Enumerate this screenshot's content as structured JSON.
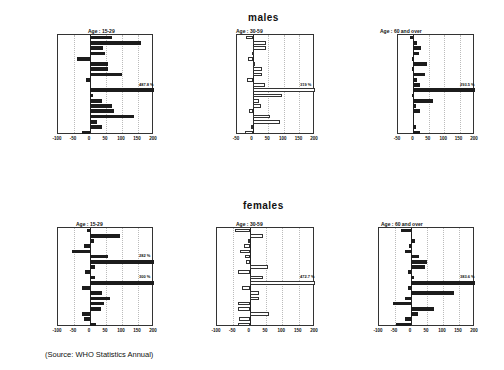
{
  "titles": {
    "males": "males",
    "females": "females"
  },
  "source": "(Source: WHO Statistics Annual)",
  "chart_data": [
    {
      "type": "bar",
      "orientation": "horizontal",
      "group": "males",
      "title": "Age : 15-29",
      "style": "dark",
      "categories": [
        "Australia",
        "Belgium",
        "Bulgaria",
        "Canada",
        "Czechoslovakia",
        "Denmark",
        "England&Wales",
        "France",
        "W-Germany",
        "Hungary",
        "Ireland",
        "Japan",
        "Mexico",
        "Netherlands",
        "New Zealand",
        "Scotland",
        "Singapore",
        "USA",
        "Venezuela"
      ],
      "values": [
        70,
        158,
        42,
        48,
        -40,
        57,
        57,
        100,
        -12,
        0,
        487.8,
        10,
        38,
        68,
        76,
        137,
        22,
        38,
        -25
      ],
      "xlim": [
        -100,
        200
      ],
      "xticks": [
        -100,
        -50,
        0,
        50,
        100,
        150,
        200
      ],
      "annotation": {
        "category": "Ireland",
        "text": "487.8 %"
      }
    },
    {
      "type": "bar",
      "orientation": "horizontal",
      "group": "males",
      "title": "Age : 30-59",
      "style": "light",
      "categories": [
        "Australia",
        "Belgium",
        "Bulgaria",
        "Canada",
        "Czechoslovakia",
        "Denmark",
        "England&Wales",
        "France",
        "W-Germany",
        "Hungary",
        "Ireland",
        "Japan",
        "Mexico",
        "Netherlands",
        "New Zealand",
        "Scotland",
        "Singapore",
        "USA",
        "Venezuela"
      ],
      "values": [
        -22,
        44,
        42,
        -2,
        -16,
        6,
        30,
        30,
        -18,
        40,
        319,
        95,
        21,
        27,
        -12,
        57,
        89,
        -5,
        -24
      ],
      "xlim": [
        -50,
        200
      ],
      "xticks": [
        -50,
        0,
        50,
        100,
        150,
        200
      ],
      "annotation": {
        "category": "Ireland",
        "text": "319 %"
      }
    },
    {
      "type": "bar",
      "orientation": "horizontal",
      "group": "males",
      "title": "Age : 60 and over",
      "style": "dark",
      "categories": [
        "Australia",
        "Belgium",
        "Bulgaria",
        "Canada",
        "Czechoslovakia",
        "Denmark",
        "England&Wales",
        "France",
        "W-Germany",
        "Hungary",
        "Ireland",
        "Japan",
        "Mexico",
        "Netherlands",
        "New Zealand",
        "Scotland",
        "Singapore",
        "USA",
        "Venezuela"
      ],
      "values": [
        -10,
        12,
        25,
        18,
        -6,
        45,
        -3,
        37,
        12,
        20,
        293.5,
        -4,
        65,
        7,
        23,
        1,
        0,
        10,
        22
      ],
      "xlim": [
        -50,
        200
      ],
      "xticks": [
        -50,
        0,
        50,
        100,
        150,
        200
      ],
      "annotation": {
        "category": "Ireland",
        "text": "293.5 %"
      }
    },
    {
      "type": "bar",
      "orientation": "horizontal",
      "group": "females",
      "title": "Age : 15-29",
      "style": "dark",
      "categories": [
        "Australia",
        "Belgium",
        "Bulgaria",
        "Canada",
        "Czechoslovakia",
        "Denmark",
        "England&Wales",
        "France",
        "W-Germany",
        "Hungary",
        "Ireland",
        "Japan",
        "Mexico",
        "Netherlands",
        "New Zealand",
        "Scotland",
        "Singapore",
        "USA",
        "Venezuela"
      ],
      "values": [
        -10,
        93,
        13,
        -20,
        -55,
        55,
        282,
        15,
        -17,
        17,
        300,
        -25,
        38,
        62,
        44,
        33,
        -25,
        -20,
        18
      ],
      "xlim": [
        -100,
        200
      ],
      "xticks": [
        -100,
        -50,
        0,
        50,
        100,
        150,
        200
      ],
      "annotations": [
        {
          "category": "England&Wales",
          "text": "282 %"
        },
        {
          "category": "Ireland",
          "text": "300 %"
        }
      ]
    },
    {
      "type": "bar",
      "orientation": "horizontal",
      "group": "females",
      "title": "Age : 30-59",
      "style": "light",
      "categories": [
        "Australia",
        "Belgium",
        "Bulgaria",
        "Canada",
        "Czechoslovakia",
        "Denmark",
        "England&Wales",
        "France",
        "W-Germany",
        "Hungary",
        "Ireland",
        "Japan",
        "Mexico",
        "Netherlands",
        "New Zealand",
        "Scotland",
        "Singapore",
        "USA",
        "Venezuela"
      ],
      "values": [
        -45,
        42,
        -5,
        -18,
        -30,
        -15,
        -12,
        57,
        -37,
        42,
        472.7,
        -22,
        28,
        28,
        -35,
        -37,
        60,
        -33,
        -35
      ],
      "xlim": [
        -100,
        200
      ],
      "xticks": [
        -100,
        -50,
        0,
        50,
        100,
        150,
        200
      ],
      "annotation": {
        "category": "Ireland",
        "text": "472.7 %"
      }
    },
    {
      "type": "bar",
      "orientation": "horizontal",
      "group": "females",
      "title": "Age : 60 and over",
      "style": "dark",
      "categories": [
        "Australia",
        "Belgium",
        "Bulgaria",
        "Canada",
        "Czechoslovakia",
        "Denmark",
        "England&Wales",
        "France",
        "W-Germany",
        "Hungary",
        "Ireland",
        "Japan",
        "Mexico",
        "Netherlands",
        "New Zealand",
        "Scotland",
        "Singapore",
        "USA",
        "Venezuela"
      ],
      "values": [
        -30,
        3,
        12,
        -5,
        -18,
        25,
        50,
        45,
        -8,
        10,
        383.6,
        -10,
        135,
        -18,
        -57,
        72,
        22,
        -18,
        -48
      ],
      "xlim": [
        -100,
        200
      ],
      "xticks": [
        -100,
        -50,
        0,
        50,
        100,
        150,
        200
      ],
      "annotation": {
        "category": "Ireland",
        "text": "383.6 %"
      }
    }
  ],
  "layout": [
    {
      "left": 57,
      "top": 34,
      "width": 96,
      "height": 100,
      "title_x": 88,
      "title_y": 28
    },
    {
      "left": 236,
      "top": 34,
      "width": 78,
      "height": 100,
      "title_x": 236,
      "title_y": 28
    },
    {
      "left": 397,
      "top": 34,
      "width": 77,
      "height": 100,
      "title_x": 380,
      "title_y": 28
    },
    {
      "left": 57,
      "top": 227,
      "width": 96,
      "height": 99,
      "title_x": 76,
      "title_y": 221
    },
    {
      "left": 216,
      "top": 227,
      "width": 98,
      "height": 99,
      "title_x": 236,
      "title_y": 221
    },
    {
      "left": 378,
      "top": 227,
      "width": 96,
      "height": 99,
      "title_x": 381,
      "title_y": 221
    }
  ]
}
